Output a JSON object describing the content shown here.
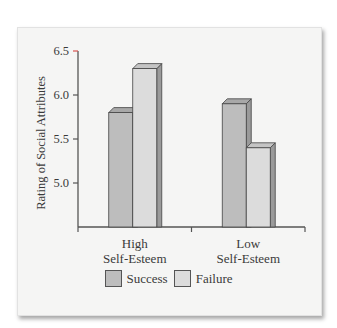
{
  "chart_data": {
    "type": "bar",
    "title": "",
    "xlabel": "",
    "ylabel": "Rating of Social Attributes",
    "categories": [
      "High\nSelf-Esteem",
      "Low\nSelf-Esteem"
    ],
    "category_lines": [
      [
        "High",
        "Self-Esteem"
      ],
      [
        "Low",
        "Self-Esteem"
      ]
    ],
    "series": [
      {
        "name": "Success",
        "values": [
          5.8,
          5.9
        ],
        "color": "#bdbdbd"
      },
      {
        "name": "Failure",
        "values": [
          6.3,
          5.4
        ],
        "color": "#dcdcdc"
      }
    ],
    "yticks": [
      5.0,
      5.5,
      6.0,
      6.5
    ],
    "ytick_labels": [
      "5.0",
      "5.5",
      "6.0",
      "6.5"
    ],
    "ylim": [
      4.5,
      6.5
    ],
    "grid": false,
    "legend_position": "bottom",
    "style": "3d-bars"
  },
  "legend": {
    "success_label": "Success",
    "failure_label": "Failure"
  },
  "colors": {
    "axis": "#555555",
    "top_tick_accent": "#d9534f",
    "success": "#bdbdbd",
    "failure": "#dcdcdc",
    "panel": "#f5f5f4"
  }
}
